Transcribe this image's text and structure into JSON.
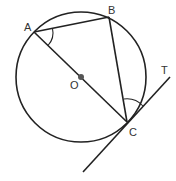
{
  "diagram": {
    "type": "circle-geometry",
    "colors": {
      "stroke": "#222222",
      "center_dot": "#555555",
      "label": "#333333",
      "background": "#ffffff"
    },
    "circle": {
      "center_label": "O",
      "cx": 81,
      "cy": 77,
      "r": 65
    },
    "points": {
      "A": {
        "label": "A",
        "x": 34,
        "y": 32
      },
      "B": {
        "label": "B",
        "x": 109,
        "y": 17
      },
      "C": {
        "label": "C",
        "x": 127,
        "y": 122
      },
      "O": {
        "label": "O",
        "x": 81,
        "y": 77
      },
      "T": {
        "label": "T",
        "x": 170,
        "y": 77
      }
    },
    "segments": [
      "AB",
      "BC",
      "AC",
      "tangent at C through T"
    ],
    "angle_marks": [
      "angle BAC",
      "angle BCT"
    ]
  }
}
